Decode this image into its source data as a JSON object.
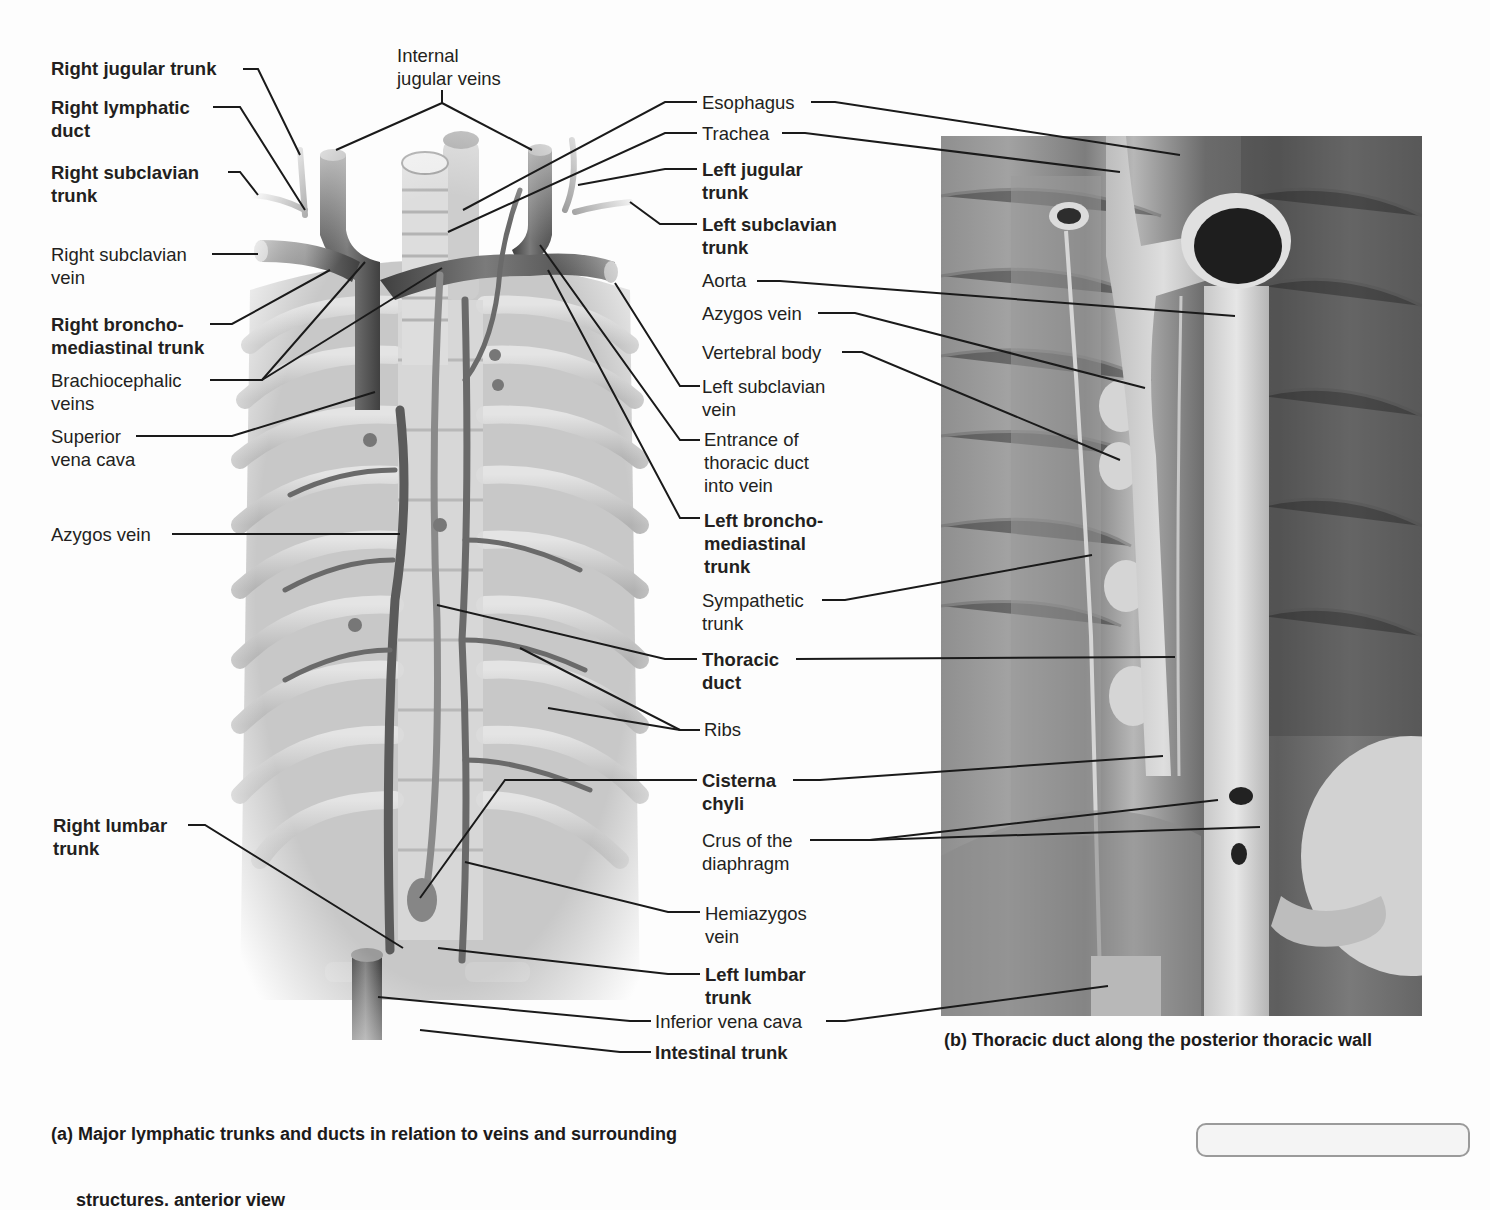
{
  "figure": {
    "panel_a": {
      "caption_line1": "(a) Major lymphatic trunks and ducts in relation to veins and surrounding",
      "caption_line2": "     structures. anterior view",
      "illustration": "anterior-view-lymphatic-trunks-illustration"
    },
    "panel_b": {
      "caption": "(b) Thoracic duct along the posterior thoracic wall",
      "photo": "cadaver-photo-posterior-thoracic-wall"
    }
  },
  "labels_left": [
    {
      "id": "right-jugular-trunk",
      "text": "Right jugular trunk",
      "bold": true,
      "x": 51,
      "y": 57
    },
    {
      "id": "right-lymphatic-duct",
      "text": "Right lymphatic\nduct",
      "bold": true,
      "x": 51,
      "y": 96
    },
    {
      "id": "right-subclavian-trunk",
      "text": "Right subclavian\ntrunk",
      "bold": true,
      "x": 51,
      "y": 161
    },
    {
      "id": "right-subclavian-vein",
      "text": "Right subclavian\nvein",
      "bold": false,
      "x": 51,
      "y": 243
    },
    {
      "id": "right-bronchomediastinal-trunk",
      "text": "Right broncho-\nmediastinal trunk",
      "bold": true,
      "x": 51,
      "y": 313
    },
    {
      "id": "brachiocephalic-veins",
      "text": "Brachiocephalic\nveins",
      "bold": false,
      "x": 51,
      "y": 369
    },
    {
      "id": "superior-vena-cava",
      "text": "Superior\nvena cava",
      "bold": false,
      "x": 51,
      "y": 425
    },
    {
      "id": "azygos-vein-a",
      "text": "Azygos vein",
      "bold": false,
      "x": 51,
      "y": 523
    },
    {
      "id": "right-lumbar-trunk",
      "text": "Right lumbar\ntrunk",
      "bold": true,
      "x": 53,
      "y": 814
    }
  ],
  "labels_top": [
    {
      "id": "internal-jugular-veins",
      "text": "Internal\njugular veins",
      "bold": false,
      "x": 397,
      "y": 44
    }
  ],
  "labels_middle": [
    {
      "id": "esophagus",
      "text": "Esophagus",
      "bold": false,
      "x": 702,
      "y": 91
    },
    {
      "id": "trachea",
      "text": "Trachea",
      "bold": false,
      "x": 702,
      "y": 122
    },
    {
      "id": "left-jugular-trunk",
      "text": "Left jugular\ntrunk",
      "bold": true,
      "x": 702,
      "y": 158
    },
    {
      "id": "left-subclavian-trunk",
      "text": "Left subclavian\ntrunk",
      "bold": true,
      "x": 702,
      "y": 213
    },
    {
      "id": "aorta",
      "text": "Aorta",
      "bold": false,
      "x": 702,
      "y": 269
    },
    {
      "id": "azygos-vein-b",
      "text": "Azygos vein",
      "bold": false,
      "x": 702,
      "y": 302
    },
    {
      "id": "vertebral-body",
      "text": "Vertebral body",
      "bold": false,
      "x": 702,
      "y": 341
    },
    {
      "id": "left-subclavian-vein",
      "text": "Left subclavian\nvein",
      "bold": false,
      "x": 702,
      "y": 375
    },
    {
      "id": "entrance-thoracic-duct",
      "text": "Entrance of\nthoracic duct\ninto vein",
      "bold": false,
      "x": 704,
      "y": 428
    },
    {
      "id": "left-bronchomediastinal-trunk",
      "text": "Left broncho-\nmediastinal\ntrunk",
      "bold": true,
      "x": 704,
      "y": 509
    },
    {
      "id": "sympathetic-trunk",
      "text": "Sympathetic\ntrunk",
      "bold": false,
      "x": 702,
      "y": 589
    },
    {
      "id": "thoracic-duct",
      "text": "Thoracic\nduct",
      "bold": true,
      "x": 702,
      "y": 648
    },
    {
      "id": "ribs",
      "text": "Ribs",
      "bold": false,
      "x": 704,
      "y": 718
    },
    {
      "id": "cisterna-chyli",
      "text": "Cisterna\nchyli",
      "bold": true,
      "x": 702,
      "y": 769
    },
    {
      "id": "crus-of-diaphragm",
      "text": "Crus of the\ndiaphragm",
      "bold": false,
      "x": 702,
      "y": 829
    },
    {
      "id": "hemiazygos-vein",
      "text": "Hemiazygos\nvein",
      "bold": false,
      "x": 705,
      "y": 902
    },
    {
      "id": "left-lumbar-trunk",
      "text": "Left lumbar\ntrunk",
      "bold": true,
      "x": 705,
      "y": 963
    },
    {
      "id": "inferior-vena-cava",
      "text": "Inferior vena cava",
      "bold": false,
      "x": 655,
      "y": 1010
    },
    {
      "id": "intestinal-trunk",
      "text": "Intestinal trunk",
      "bold": true,
      "x": 655,
      "y": 1041
    }
  ],
  "leader_lines": [
    {
      "for": "right-jugular-trunk",
      "points": "243,69 258,69 300,155"
    },
    {
      "for": "right-lymphatic-duct",
      "points": "213,107 240,107 305,210"
    },
    {
      "for": "right-subclavian-trunk",
      "points": "228,172 240,172 258,195"
    },
    {
      "for": "right-subclavian-vein",
      "points": "212,254 258,254"
    },
    {
      "for": "right-bronchomediastinal-trunk",
      "points": "210,324 232,324 330,270"
    },
    {
      "for": "brachiocephalic-veins",
      "points": "210,380 262,380 365,262"
    },
    {
      "for": "brachiocephalic-veins",
      "points": "262,380 442,268"
    },
    {
      "for": "superior-vena-cava",
      "points": "136,436 232,436 375,392"
    },
    {
      "for": "azygos-vein-a",
      "points": "172,534 400,534"
    },
    {
      "for": "right-lumbar-trunk",
      "points": "188,825 205,825 403,948"
    },
    {
      "for": "internal-jugular-veins",
      "points": "442,90 442,103 336,150"
    },
    {
      "for": "internal-jugular-veins",
      "points": "442,103 532,150"
    },
    {
      "for": "esophagus",
      "points": "697,102 665,102 463,210"
    },
    {
      "for": "esophagus",
      "points": "811,102 835,102 1180,155"
    },
    {
      "for": "trachea",
      "points": "697,133 665,133 448,232"
    },
    {
      "for": "trachea",
      "points": "782,133 805,133 1120,172"
    },
    {
      "for": "left-jugular-trunk",
      "points": "697,169 665,169 578,185"
    },
    {
      "for": "left-subclavian-trunk",
      "points": "697,224 660,224 630,202"
    },
    {
      "for": "aorta",
      "points": "757,281 780,281 1235,316"
    },
    {
      "for": "azygos-vein-b",
      "points": "818,313 855,313 1145,388"
    },
    {
      "for": "vertebral-body",
      "points": "842,352 862,352 1120,460"
    },
    {
      "for": "left-subclavian-vein",
      "points": "700,386 680,386 615,283"
    },
    {
      "for": "entrance-thoracic-duct",
      "points": "700,440 680,440 540,245"
    },
    {
      "for": "left-bronchomediastinal-trunk",
      "points": "700,518 680,518 548,270"
    },
    {
      "for": "sympathetic-trunk",
      "points": "822,600 845,600 1092,555"
    },
    {
      "for": "thoracic-duct",
      "points": "697,659 665,659 437,605"
    },
    {
      "for": "thoracic-duct",
      "points": "796,659 1175,657"
    },
    {
      "for": "ribs",
      "points": "700,730 680,730 520,648"
    },
    {
      "for": "ribs",
      "points": "680,730 548,708"
    },
    {
      "for": "cisterna-chyli",
      "points": "697,780 505,780 420,898"
    },
    {
      "for": "cisterna-chyli",
      "points": "793,780 820,780 1163,756"
    },
    {
      "for": "crus-of-diaphragm",
      "points": "810,840 870,840 1218,800"
    },
    {
      "for": "crus-of-diaphragm",
      "points": "870,840 1260,827"
    },
    {
      "for": "hemiazygos-vein",
      "points": "700,912 668,912 465,862"
    },
    {
      "for": "left-lumbar-trunk",
      "points": "700,974 668,974 438,948"
    },
    {
      "for": "inferior-vena-cava",
      "points": "651,1021 630,1021 378,997"
    },
    {
      "for": "inferior-vena-cava",
      "points": "826,1021 845,1021 1108,986"
    },
    {
      "for": "intestinal-trunk",
      "points": "651,1052 620,1052 420,1030"
    }
  ],
  "colors": {
    "text": "#231f20",
    "leader": "#1a1a1a",
    "vein": "#5d5d5d",
    "vein_light": "#8a8a8a",
    "rib": "#c9c9c9",
    "trachea": "#dcdcdc",
    "background": "#fdfdfd"
  }
}
